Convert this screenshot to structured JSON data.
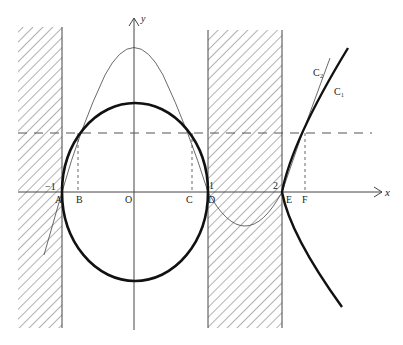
{
  "figure": {
    "axes": {
      "x_label": "x",
      "y_label": "y",
      "origin_label": "O"
    },
    "points": {
      "A": "A",
      "B": "B",
      "O": "O",
      "C": "C",
      "D": "D",
      "E": "E",
      "F": "F"
    },
    "tick_labels": {
      "neg_one": "−1",
      "one": "1",
      "two": "2"
    },
    "curves": {
      "c1": "C₁",
      "c2": "C₂"
    },
    "colors": {
      "ink": "#222222",
      "hatch": "#555555",
      "background": "#ffffff"
    }
  }
}
